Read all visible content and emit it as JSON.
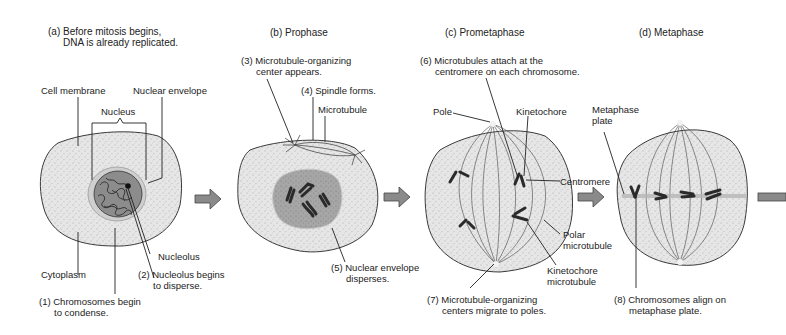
{
  "stages": [
    {
      "id": "a",
      "title_line1": "(a) Before mitosis begins,",
      "title_line2": "DNA is already replicated."
    },
    {
      "id": "b",
      "title": "(b) Prophase"
    },
    {
      "id": "c",
      "title": "(c) Prometaphase"
    },
    {
      "id": "d",
      "title": "(d) Metaphase"
    }
  ],
  "labels": {
    "cell_membrane": "Cell membrane",
    "nuclear_envelope": "Nuclear envelope",
    "nucleus": "Nucleus",
    "nucleolus": "Nucleolus",
    "cytoplasm": "Cytoplasm",
    "step1_line1": "(1) Chromosomes begin",
    "step1_line2": "to condense.",
    "step2_line1": "(2) Nucleolus begins",
    "step2_line2": "to disperse.",
    "step3_line1": "(3) Microtubule-organizing",
    "step3_line2": "center appears.",
    "step4": "(4) Spindle forms.",
    "microtubule": "Microtubule",
    "step5_line1": "(5) Nuclear envelope",
    "step5_line2": "disperses.",
    "step6_line1": "(6) Microtubules attach at the",
    "step6_line2": "centromere on each chromosome.",
    "pole": "Pole",
    "kinetochore": "Kinetochore",
    "centromere": "Centromere",
    "polar_mt_line1": "Polar",
    "polar_mt_line2": "microtubule",
    "kinetochore_mt_line1": "Kinetochore",
    "kinetochore_mt_line2": "microtubule",
    "step7_line1": "(7) Microtubule-organizing",
    "step7_line2": "centers migrate to poles.",
    "metaphase_plate_line1": "Metaphase",
    "metaphase_plate_line2": "plate",
    "step8_line1": "(8) Chromosomes align on",
    "step8_line2": "metaphase plate."
  },
  "colors": {
    "cytoplasm": "#e4e4e4",
    "nucleus": "#a9a9a9",
    "outline": "#3a3a3a",
    "chromosome": "#333333",
    "arrow_fill": "#8a8a8a",
    "plate": "#b5b5b5"
  }
}
